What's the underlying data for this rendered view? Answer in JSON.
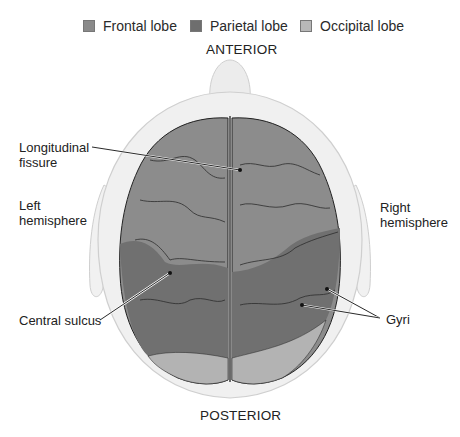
{
  "legend": {
    "items": [
      {
        "label": "Frontal lobe",
        "color": "#8a8a8a"
      },
      {
        "label": "Parietal lobe",
        "color": "#6e6e6e"
      },
      {
        "label": "Occipital lobe",
        "color": "#b5b5b5"
      }
    ]
  },
  "orientation": {
    "top": "ANTERIOR",
    "bottom": "POSTERIOR"
  },
  "labels": {
    "longitudinal_fissure_line1": "Longitudinal",
    "longitudinal_fissure_line2": "fissure",
    "left_hemisphere_line1": "Left",
    "left_hemisphere_line2": "hemisphere",
    "right_hemisphere_line1": "Right",
    "right_hemisphere_line2": "hemisphere",
    "central_sulcus": "Central sulcus",
    "gyri": "Gyri"
  },
  "colors": {
    "frontal": "#8c8c8c",
    "parietal": "#6f6f6f",
    "occipital": "#b3b3b3",
    "head": "#efefef",
    "head_outline": "#cfcfcf"
  }
}
